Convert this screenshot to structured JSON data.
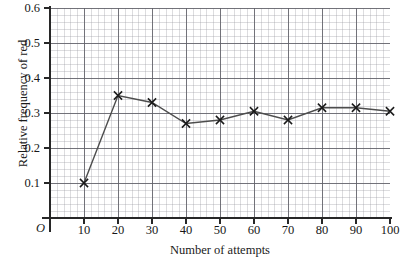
{
  "chart_data": {
    "type": "line",
    "title": "",
    "xlabel": "Number of attempts",
    "ylabel": "Relative frequency of red",
    "origin_label": "O",
    "x": [
      10,
      20,
      30,
      40,
      50,
      60,
      70,
      80,
      90,
      100
    ],
    "values": [
      0.1,
      0.35,
      0.33,
      0.27,
      0.28,
      0.305,
      0.28,
      0.315,
      0.315,
      0.305
    ],
    "series": [
      {
        "name": "Relative frequency of red",
        "values": [
          0.1,
          0.35,
          0.33,
          0.27,
          0.28,
          0.305,
          0.28,
          0.315,
          0.315,
          0.305
        ]
      }
    ],
    "xlim": [
      0,
      100
    ],
    "ylim": [
      0,
      0.6
    ],
    "x_ticks": [
      "10",
      "20",
      "30",
      "40",
      "50",
      "60",
      "70",
      "80",
      "90",
      "100"
    ],
    "y_ticks": [
      "0.1",
      "0.2",
      "0.3",
      "0.4",
      "0.5",
      "0.6"
    ],
    "x_tick_values": [
      10,
      20,
      30,
      40,
      50,
      60,
      70,
      80,
      90,
      100
    ],
    "y_tick_values": [
      0.1,
      0.2,
      0.3,
      0.4,
      0.5,
      0.6
    ],
    "grid": true,
    "grid_minor": true,
    "legend": "none",
    "marker": "x",
    "line_color": "#4d4d4d",
    "marker_color": "#1a1a1a",
    "axis_color": "#272727",
    "grid_major_color": "#60606c",
    "grid_minor_color": "#9696a0"
  }
}
